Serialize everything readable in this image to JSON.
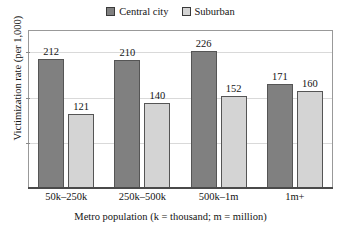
{
  "chart_data": {
    "type": "bar",
    "title": "",
    "xlabel": "Metro population (k = thousand; m = million)",
    "ylabel": "Victimization rate (per 1,000)",
    "categories": [
      "50k–250k",
      "250k–500k",
      "500k–1m",
      "1m+"
    ],
    "series": [
      {
        "name": "Central city",
        "color": "#808080",
        "values": [
          212,
          210,
          226,
          171
        ],
        "labels": [
          "212",
          "210",
          "226",
          "171"
        ]
      },
      {
        "name": "Suburban",
        "color": "#d4d4d4",
        "values": [
          121,
          140,
          152,
          160
        ],
        "labels": [
          "121",
          "140",
          "152",
          "160"
        ]
      }
    ],
    "ylim": [
      0,
      260
    ],
    "yticks": [
      75,
      150,
      225
    ],
    "ytick_labels": [],
    "grid": true,
    "legend_position": "top-center",
    "value_labels_shown": true
  },
  "legend": {
    "entries": [
      {
        "label": "Central city",
        "swatch_name": "legend-swatch-central-city"
      },
      {
        "label": "Suburban",
        "swatch_name": "legend-swatch-suburban"
      }
    ]
  },
  "axes": {
    "y_title": "Victimization rate (per 1,000)",
    "x_title": "Metro population (k = thousand; m = million)"
  },
  "colors": {
    "central_city": "#808080",
    "suburban": "#d4d4d4",
    "bar_border": "#555555",
    "gridline": "#d9d9d9",
    "frame": "#999999",
    "baseline": "#4a4a4a",
    "text": "#141414",
    "background": "#ffffff"
  }
}
